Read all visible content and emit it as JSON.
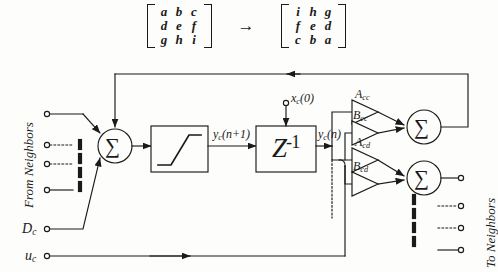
{
  "figure": {
    "line_color": "#1a1a1a",
    "background": "#fdfdfb"
  },
  "matrix_note": {
    "arrow": "→",
    "left_matrix": {
      "rows": [
        [
          "a",
          "b",
          "c"
        ],
        [
          "d",
          "e",
          "f"
        ],
        [
          "g",
          "h",
          "i"
        ]
      ]
    },
    "right_matrix": {
      "rows": [
        [
          "i",
          "h",
          "g"
        ],
        [
          "f",
          "e",
          "d"
        ],
        [
          "c",
          "b",
          "a"
        ]
      ]
    }
  },
  "labels": {
    "from_neighbors": "From Neighbors",
    "to_neighbors": "To Neighbors",
    "d_c": "D",
    "d_c_sub": "c",
    "u_c": "u",
    "u_c_sub": "c",
    "x_init": "x",
    "x_init_sub": "c",
    "x_init_arg": "(0)",
    "y_next": "y",
    "y_next_sub": "c",
    "y_next_arg": "(n+1)",
    "y_now": "y",
    "y_now_sub": "c",
    "y_now_arg": "(n)",
    "delay_z": "Z",
    "delay_exp": "-1",
    "sum_symbol": "∑",
    "gain_acc": "A",
    "gain_acc_sub": "cc",
    "gain_bcc": "B",
    "gain_bcc_sub": "cc",
    "gain_acd": "A",
    "gain_acd_sub": "cd",
    "gain_bcd": "B",
    "gain_bcd_sub": "cd"
  },
  "blocks": [
    {
      "name": "saturation-nonlinearity",
      "label": "saturation"
    },
    {
      "name": "unit-delay",
      "label": "Z-1"
    }
  ],
  "summing_nodes": [
    {
      "name": "input-summing-node",
      "symbol": "∑"
    },
    {
      "name": "feedback-summing-node",
      "symbol": "∑"
    },
    {
      "name": "output-summing-node",
      "symbol": "∑"
    }
  ],
  "input_terminals": 4,
  "output_terminals": 4
}
